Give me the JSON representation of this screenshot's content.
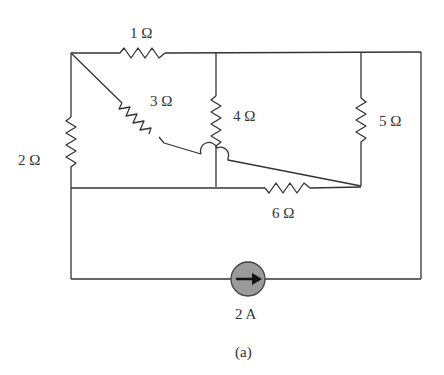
{
  "figure": {
    "caption": "(a)",
    "components": {
      "r1": {
        "label": "1 Ω",
        "value": "1",
        "unit": "Ω"
      },
      "r2": {
        "label": "2 Ω",
        "value": "2",
        "unit": "Ω"
      },
      "r3": {
        "label": "3 Ω",
        "value": "3",
        "unit": "Ω"
      },
      "r4": {
        "label": "4 Ω",
        "value": "4",
        "unit": "Ω"
      },
      "r5": {
        "label": "5 Ω",
        "value": "5",
        "unit": "Ω"
      },
      "r6": {
        "label": "6 Ω",
        "value": "6",
        "unit": "Ω"
      },
      "source": {
        "label": "2 A",
        "type": "current-source",
        "direction": "right",
        "fill": "#9a9a9a"
      }
    },
    "colors": {
      "wire": "#333333",
      "background": "#ffffff"
    }
  }
}
